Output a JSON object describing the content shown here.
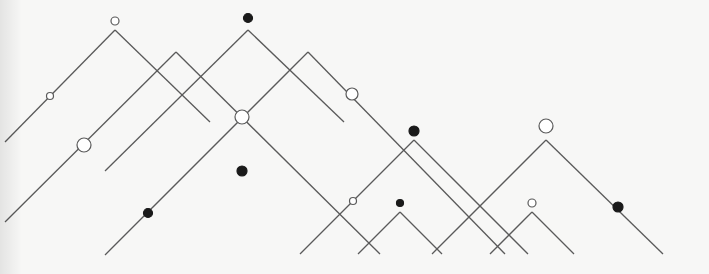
{
  "diagram": {
    "type": "line-tree-diagram",
    "stroke_color": "#5a5a5a",
    "node_fill_solid": "#1a1a1a",
    "node_fill_hollow": "#ffffff",
    "segments": [
      {
        "id": "A-left",
        "x1": 115,
        "y1": 30,
        "x2": 5,
        "y2": 142
      },
      {
        "id": "A-right",
        "x1": 115,
        "y1": 30,
        "x2": 210,
        "y2": 122
      },
      {
        "id": "B-left",
        "x1": 176,
        "y1": 52,
        "x2": 5,
        "y2": 222
      },
      {
        "id": "B-right",
        "x1": 176,
        "y1": 52,
        "x2": 380,
        "y2": 254
      },
      {
        "id": "C-left",
        "x1": 248,
        "y1": 30,
        "x2": 105,
        "y2": 171
      },
      {
        "id": "C-right",
        "x1": 248,
        "y1": 30,
        "x2": 344,
        "y2": 122
      },
      {
        "id": "D-left",
        "x1": 308,
        "y1": 52,
        "x2": 105,
        "y2": 255
      },
      {
        "id": "D-right",
        "x1": 308,
        "y1": 52,
        "x2": 505,
        "y2": 254
      },
      {
        "id": "E-left",
        "x1": 414,
        "y1": 140,
        "x2": 300,
        "y2": 254
      },
      {
        "id": "E-right",
        "x1": 414,
        "y1": 140,
        "x2": 528,
        "y2": 254
      },
      {
        "id": "F-left",
        "x1": 400,
        "y1": 212,
        "x2": 358,
        "y2": 254
      },
      {
        "id": "F-right",
        "x1": 400,
        "y1": 212,
        "x2": 442,
        "y2": 254
      },
      {
        "id": "G-left",
        "x1": 546,
        "y1": 140,
        "x2": 432,
        "y2": 254
      },
      {
        "id": "G-right",
        "x1": 546,
        "y1": 140,
        "x2": 663,
        "y2": 254
      },
      {
        "id": "H-left",
        "x1": 532,
        "y1": 212,
        "x2": 490,
        "y2": 254
      },
      {
        "id": "H-right",
        "x1": 532,
        "y1": 212,
        "x2": 574,
        "y2": 254
      }
    ],
    "nodes": [
      {
        "id": "A-top",
        "cx": 115,
        "cy": 21,
        "r": 4,
        "style": "hollow"
      },
      {
        "id": "A-mid",
        "cx": 50,
        "cy": 96,
        "r": 3.5,
        "style": "hollow"
      },
      {
        "id": "B-mid",
        "cx": 84,
        "cy": 145,
        "r": 7,
        "style": "hollow"
      },
      {
        "id": "C-top",
        "cx": 248,
        "cy": 18,
        "r": 4.5,
        "style": "solid"
      },
      {
        "id": "D-mid",
        "cx": 242,
        "cy": 117,
        "r": 7,
        "style": "hollow"
      },
      {
        "id": "D-low",
        "cx": 148,
        "cy": 213,
        "r": 4.5,
        "style": "solid"
      },
      {
        "id": "free",
        "cx": 242,
        "cy": 171,
        "r": 5,
        "style": "solid"
      },
      {
        "id": "D-right",
        "cx": 352,
        "cy": 94,
        "r": 6,
        "style": "hollow"
      },
      {
        "id": "E-top",
        "cx": 414,
        "cy": 131,
        "r": 5,
        "style": "solid"
      },
      {
        "id": "E-mid",
        "cx": 353,
        "cy": 201,
        "r": 3.5,
        "style": "hollow"
      },
      {
        "id": "F-top",
        "cx": 400,
        "cy": 203,
        "r": 3.5,
        "style": "solid"
      },
      {
        "id": "G-top",
        "cx": 546,
        "cy": 126,
        "r": 7,
        "style": "hollow"
      },
      {
        "id": "G-mid",
        "cx": 618,
        "cy": 207,
        "r": 5,
        "style": "solid"
      },
      {
        "id": "H-top",
        "cx": 532,
        "cy": 203,
        "r": 4,
        "style": "hollow"
      }
    ]
  }
}
